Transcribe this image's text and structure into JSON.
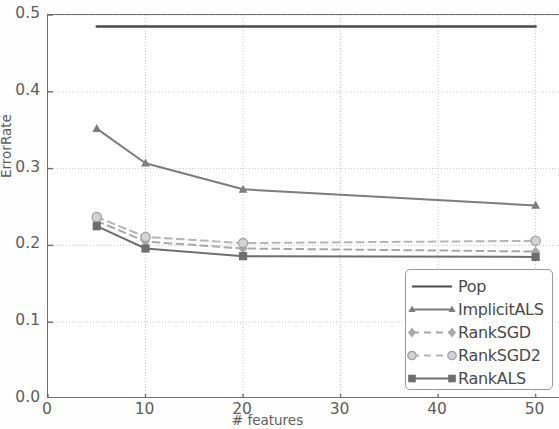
{
  "chart_data": {
    "type": "line",
    "title": "",
    "xlabel": "# features",
    "ylabel": "ErrorRate",
    "xlim": [
      0,
      52.5
    ],
    "ylim": [
      0.0,
      0.5
    ],
    "x": [
      5,
      10,
      20,
      50
    ],
    "grid": true,
    "grid_style": "dotted",
    "legend_position": "lower right",
    "xticks": [
      "0",
      "10",
      "20",
      "30",
      "40",
      "50"
    ],
    "xtick_values": [
      0,
      10,
      20,
      30,
      40,
      50
    ],
    "yticks": [
      "0.0",
      "0.1",
      "0.2",
      "0.3",
      "0.4",
      "0.5"
    ],
    "ytick_values": [
      0.0,
      0.1,
      0.2,
      0.3,
      0.4,
      0.5
    ],
    "series": [
      {
        "name": "Pop",
        "marker": "none",
        "linestyle": "solid",
        "color": "#4a4a4a",
        "values": [
          0.485,
          0.485,
          0.485,
          0.485
        ]
      },
      {
        "name": "ImplicitALS",
        "marker": "triangle",
        "linestyle": "solid",
        "color": "#7d7d7d",
        "values": [
          0.352,
          0.307,
          0.273,
          0.252
        ]
      },
      {
        "name": "RankSGD",
        "marker": "diamond",
        "linestyle": "dashed",
        "color": "#a8a8a8",
        "values": [
          0.232,
          0.205,
          0.196,
          0.192
        ]
      },
      {
        "name": "RankSGD2",
        "marker": "circle",
        "linestyle": "dashed",
        "color": "#b5b5b5",
        "values": [
          0.237,
          0.211,
          0.203,
          0.206
        ]
      },
      {
        "name": "RankALS",
        "marker": "square",
        "linestyle": "solid",
        "color": "#6e6e6e",
        "values": [
          0.225,
          0.196,
          0.186,
          0.185
        ]
      }
    ]
  },
  "legend": {
    "items": [
      {
        "label": "Pop"
      },
      {
        "label": "ImplicitALS"
      },
      {
        "label": "RankSGD"
      },
      {
        "label": "RankSGD2"
      },
      {
        "label": "RankALS"
      }
    ]
  }
}
